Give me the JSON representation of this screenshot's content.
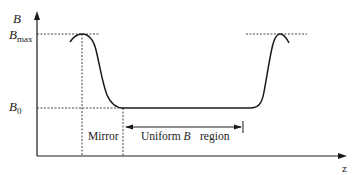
{
  "diagram": {
    "y_axis": {
      "label": "B"
    },
    "x_axis": {
      "label": "z"
    },
    "levels": {
      "bmax": {
        "symbol": "B",
        "subscript": "max"
      },
      "b0": {
        "symbol": "B",
        "subscript": "0"
      }
    },
    "regions": {
      "mirror": "Mirror",
      "uniform_prefix": "Uniform ",
      "uniform_symbol": "B",
      "uniform_suffix": "region"
    },
    "colors": {
      "line": "#1a1a1a",
      "dashed": "#333333",
      "background": "#ffffff"
    }
  }
}
